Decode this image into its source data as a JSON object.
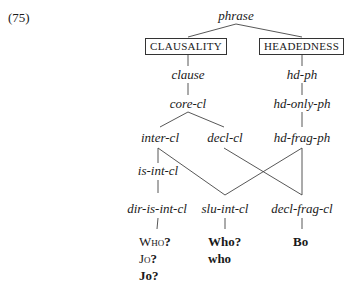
{
  "example_number": "(75)",
  "root": "phrase",
  "dimensions": {
    "clausality": "CLAUSALITY",
    "headedness": "HEADEDNESS"
  },
  "clausality_types": {
    "clause": "clause",
    "core_cl": "core-cl",
    "inter_cl": "inter-cl",
    "decl_cl": "decl-cl",
    "is_int_cl": "is-int-cl"
  },
  "headedness_types": {
    "hd_ph": "hd-ph",
    "hd_only_ph": "hd-only-ph",
    "hd_frag_ph": "hd-frag-ph"
  },
  "leaf_types": {
    "dir_is_int_cl": "dir-is-int-cl",
    "slu_int_cl": "slu-int-cl",
    "decl_frag_cl": "decl-frag-cl"
  },
  "examples": {
    "dir_is_int_cl": [
      {
        "text": "Who",
        "punct": "?",
        "style": "small-caps"
      },
      {
        "text": "Jo",
        "punct": "?",
        "style": "small-caps"
      },
      {
        "text": "Jo",
        "punct": "?",
        "style": "bold"
      }
    ],
    "slu_int_cl": [
      "Who?",
      "who"
    ],
    "decl_frag_cl": [
      "Bo"
    ]
  }
}
